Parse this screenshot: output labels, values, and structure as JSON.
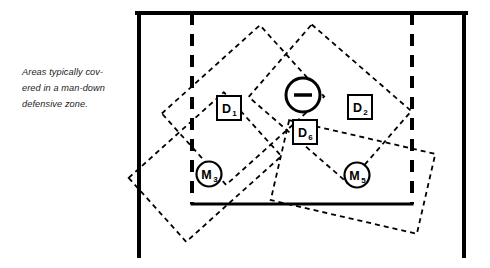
{
  "caption": {
    "lines": "Areas typically cov-\nered in a man-down\ndefensive zone."
  },
  "colors": {
    "ink": "#000000",
    "background": "#ffffff"
  },
  "diagram": {
    "rink": {
      "left_boundary_x": 139,
      "right_boundary_x": 464,
      "top_y": 13,
      "bottom_line_y": 204,
      "left_line_bottom_y": 256,
      "right_line_bottom_y": 256,
      "stroke_width": 4
    },
    "restraining_lines": [
      {
        "name": "left-restraining-line",
        "x": 192,
        "y1": 13,
        "y2": 204
      },
      {
        "name": "right-restraining-line",
        "x": 412,
        "y1": 13,
        "y2": 204
      }
    ],
    "zones": [
      {
        "name": "zone-upper-left",
        "center_x": 243,
        "center_y": 105,
        "width": 132,
        "height": 96,
        "rotation": -42
      },
      {
        "name": "zone-upper-right",
        "center_x": 330,
        "center_y": 104,
        "width": 132,
        "height": 96,
        "rotation": 41
      },
      {
        "name": "zone-lower-left",
        "center_x": 205,
        "center_y": 167,
        "width": 128,
        "height": 86,
        "rotation": -42
      },
      {
        "name": "zone-lower-right",
        "center_x": 353,
        "center_y": 177,
        "width": 150,
        "height": 82,
        "rotation": 13
      }
    ],
    "goalie": {
      "name": "goalie-marker",
      "cx": 303,
      "cy": 95,
      "r": 17,
      "stroke_width": 3,
      "dash_half_width": 9,
      "dash_thickness": 3.5
    },
    "player_boxes": [
      {
        "name": "player-box-d1",
        "label": "D",
        "sub": "1",
        "x": 217,
        "y": 96,
        "w": 24,
        "h": 24
      },
      {
        "name": "player-box-d2",
        "label": "D",
        "sub": "2",
        "x": 348,
        "y": 95,
        "w": 24,
        "h": 24
      },
      {
        "name": "player-box-d6",
        "label": "D",
        "sub": "6",
        "x": 293,
        "y": 120,
        "w": 24,
        "h": 24
      }
    ],
    "player_circles": [
      {
        "name": "player-circle-m3",
        "label": "M",
        "sub": "3",
        "cx": 209,
        "cy": 174,
        "r": 12.5
      },
      {
        "name": "player-circle-m5",
        "label": "M",
        "sub": "5",
        "cx": 357,
        "cy": 175,
        "r": 12.5
      }
    ]
  }
}
